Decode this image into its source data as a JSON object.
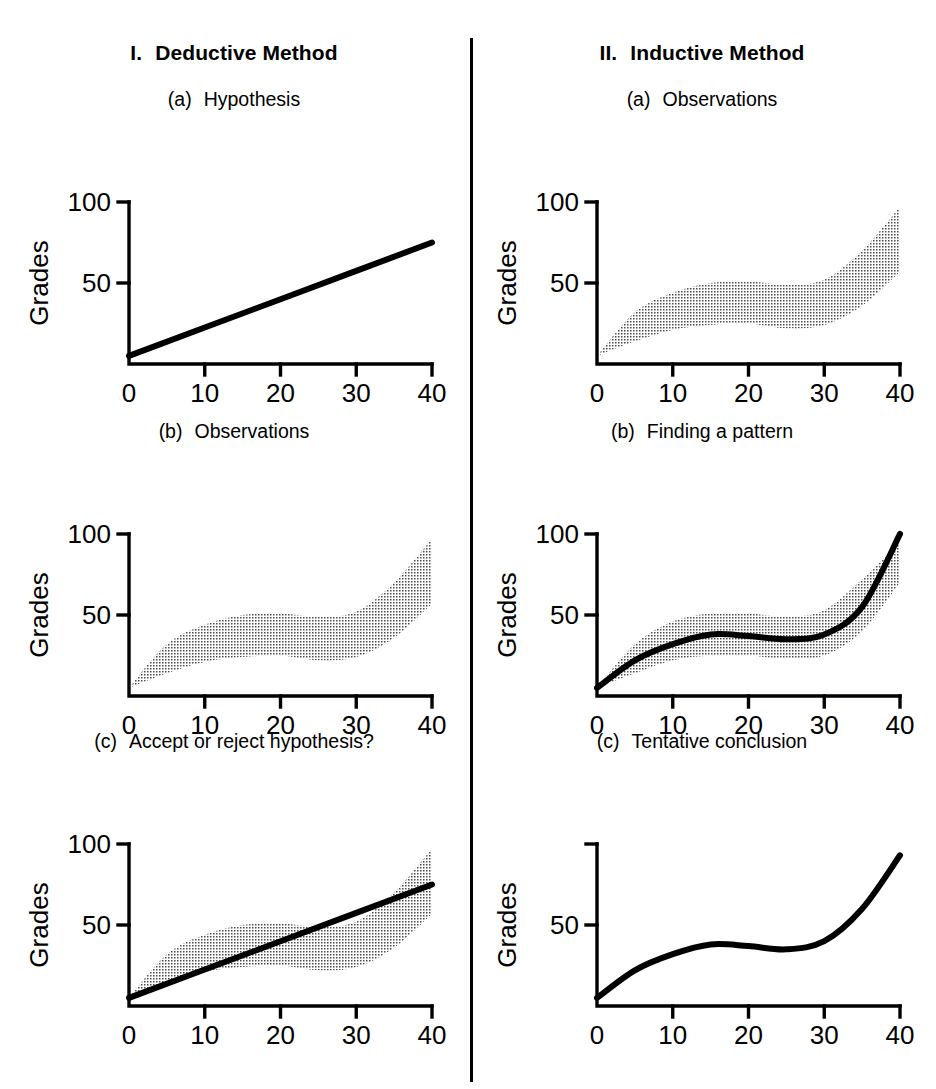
{
  "figure": {
    "background": "#ffffff",
    "ink_color": "#000000",
    "stipple_color": "#4a4a4a",
    "columns": [
      {
        "numeral": "I.",
        "title": "Deductive Method"
      },
      {
        "numeral": "II.",
        "title": "Inductive Method"
      }
    ]
  },
  "panels": [
    {
      "id": "Ia",
      "tag": "(a)",
      "title": "Hypothesis"
    },
    {
      "id": "Ib",
      "tag": "(b)",
      "title": "Observations"
    },
    {
      "id": "Ic",
      "tag": "(c)",
      "title": "Accept or reject hypothesis?"
    },
    {
      "id": "IIa",
      "tag": "(a)",
      "title": "Observations"
    },
    {
      "id": "IIb",
      "tag": "(b)",
      "title": "Finding a pattern"
    },
    {
      "id": "IIc",
      "tag": "(c)",
      "title": "Tentative conclusion"
    }
  ],
  "axes": {
    "xlabel": "Hours studying",
    "ylabel": "Grades",
    "xticks": [
      "0",
      "10",
      "20",
      "30",
      "40"
    ],
    "xtick_values": [
      0,
      10,
      20,
      30,
      40
    ],
    "yticks": [
      "50",
      "100"
    ],
    "ytick_values": [
      50,
      100
    ],
    "xlim": [
      0,
      40
    ],
    "ylim": [
      0,
      100
    ],
    "grid": false
  },
  "chart_data": [
    {
      "id": "Ia",
      "type": "line",
      "title": "Hypothesis",
      "panel_label": "(a)",
      "column": "I. Deductive Method",
      "xlabel": "Hours studying",
      "ylabel": "Grades",
      "xlim": [
        0,
        40
      ],
      "ylim": [
        0,
        100
      ],
      "xticks": [
        0,
        10,
        20,
        30,
        40
      ],
      "yticks": [
        50,
        100
      ],
      "grid": false,
      "series": [
        {
          "name": "hypothesis-line",
          "style": "solid-thick",
          "x": [
            0,
            10,
            20,
            30,
            40
          ],
          "values": [
            5,
            22.5,
            40,
            57.5,
            75
          ]
        }
      ]
    },
    {
      "id": "Ib",
      "type": "area",
      "title": "Observations",
      "panel_label": "(b)",
      "column": "I. Deductive Method",
      "xlabel": "Hours studying",
      "ylabel": "Grades",
      "xlim": [
        0,
        40
      ],
      "ylim": [
        0,
        100
      ],
      "xticks": [
        0,
        10,
        20,
        30,
        40
      ],
      "yticks": [
        50,
        100
      ],
      "grid": false,
      "series": [
        {
          "name": "observation-band-upper",
          "style": "stipple-band-edge",
          "x": [
            0,
            5,
            10,
            15,
            20,
            25,
            30,
            35,
            40
          ],
          "values": [
            5,
            32,
            44,
            50,
            51,
            49,
            52,
            70,
            97
          ]
        },
        {
          "name": "observation-band-lower",
          "style": "stipple-band-edge",
          "x": [
            0,
            5,
            10,
            15,
            20,
            25,
            30,
            35,
            40
          ],
          "values": [
            5,
            14,
            21,
            24,
            25,
            22,
            24,
            36,
            57
          ]
        }
      ]
    },
    {
      "id": "Ic",
      "type": "line",
      "title": "Accept or reject hypothesis?",
      "panel_label": "(c)",
      "column": "I. Deductive Method",
      "xlabel": "Hours studying",
      "ylabel": "Grades",
      "xlim": [
        0,
        40
      ],
      "ylim": [
        0,
        100
      ],
      "xticks": [
        0,
        10,
        20,
        30,
        40
      ],
      "yticks": [
        50,
        100
      ],
      "grid": false,
      "series": [
        {
          "name": "observation-band-upper",
          "style": "stipple-band-edge",
          "x": [
            0,
            5,
            10,
            15,
            20,
            25,
            30,
            35,
            40
          ],
          "values": [
            5,
            32,
            44,
            50,
            51,
            49,
            52,
            70,
            97
          ]
        },
        {
          "name": "observation-band-lower",
          "style": "stipple-band-edge",
          "x": [
            0,
            5,
            10,
            15,
            20,
            25,
            30,
            35,
            40
          ],
          "values": [
            5,
            14,
            21,
            24,
            25,
            22,
            24,
            36,
            57
          ]
        },
        {
          "name": "hypothesis-line",
          "style": "solid-thick",
          "x": [
            0,
            10,
            20,
            30,
            40
          ],
          "values": [
            5,
            22.5,
            40,
            57.5,
            75
          ]
        }
      ]
    },
    {
      "id": "IIa",
      "type": "area",
      "title": "Observations",
      "panel_label": "(a)",
      "column": "II. Inductive Method",
      "xlabel": "Hours studying",
      "ylabel": "Grades",
      "xlim": [
        0,
        40
      ],
      "ylim": [
        0,
        100
      ],
      "xticks": [
        0,
        10,
        20,
        30,
        40
      ],
      "yticks": [
        50,
        100
      ],
      "grid": false,
      "series": [
        {
          "name": "observation-band-upper",
          "style": "stipple-band-edge",
          "x": [
            0,
            5,
            10,
            15,
            20,
            25,
            30,
            35,
            40
          ],
          "values": [
            5,
            32,
            44,
            50,
            51,
            49,
            52,
            70,
            97
          ]
        },
        {
          "name": "observation-band-lower",
          "style": "stipple-band-edge",
          "x": [
            0,
            5,
            10,
            15,
            20,
            25,
            30,
            35,
            40
          ],
          "values": [
            5,
            14,
            21,
            24,
            25,
            22,
            24,
            36,
            57
          ]
        }
      ]
    },
    {
      "id": "IIb",
      "type": "line",
      "title": "Finding a pattern",
      "panel_label": "(b)",
      "column": "II. Inductive Method",
      "xlabel": "Hours studying",
      "ylabel": "Grades",
      "xlim": [
        0,
        40
      ],
      "ylim": [
        0,
        100
      ],
      "xticks": [
        0,
        10,
        20,
        30,
        40
      ],
      "yticks": [
        50,
        100
      ],
      "grid": false,
      "series": [
        {
          "name": "observation-band-upper",
          "style": "stipple-band-edge",
          "x": [
            0,
            5,
            10,
            15,
            20,
            25,
            30,
            35,
            40
          ],
          "values": [
            5,
            32,
            46,
            51,
            51,
            49,
            53,
            72,
            95
          ]
        },
        {
          "name": "observation-band-lower",
          "style": "stipple-band-edge",
          "x": [
            0,
            5,
            10,
            15,
            20,
            25,
            30,
            35,
            40
          ],
          "values": [
            5,
            14,
            22,
            25,
            25,
            23,
            25,
            40,
            70
          ]
        },
        {
          "name": "pattern-curve",
          "style": "solid-thick",
          "x": [
            0,
            5,
            10,
            15,
            20,
            25,
            30,
            35,
            40
          ],
          "values": [
            5,
            22,
            32,
            38,
            37,
            35,
            38,
            55,
            100
          ]
        }
      ]
    },
    {
      "id": "IIc",
      "type": "line",
      "title": "Tentative conclusion",
      "panel_label": "(c)",
      "column": "II. Inductive Method",
      "xlabel": "Hours studying",
      "ylabel": "Grades",
      "xlim": [
        0,
        40
      ],
      "ylim": [
        0,
        100
      ],
      "xticks": [
        0,
        10,
        20,
        30,
        40
      ],
      "yticks": [
        50
      ],
      "grid": false,
      "series": [
        {
          "name": "conclusion-curve",
          "style": "solid-thick",
          "x": [
            0,
            5,
            10,
            15,
            20,
            25,
            30,
            35,
            40
          ],
          "values": [
            5,
            22,
            32,
            38,
            37,
            35,
            40,
            60,
            93
          ]
        }
      ]
    }
  ]
}
